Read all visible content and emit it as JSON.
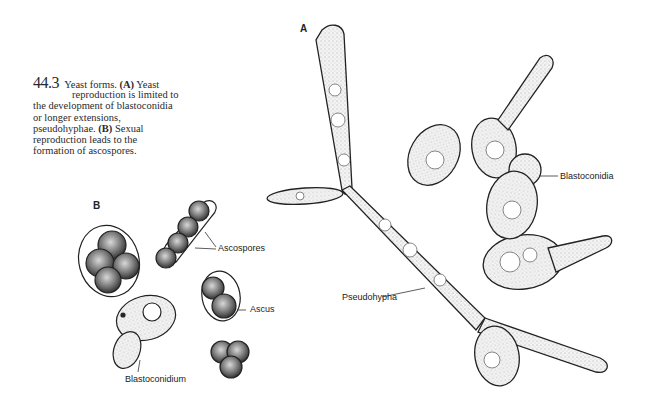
{
  "figure": {
    "number": "44.3",
    "caption": {
      "title": "Yeast forms.",
      "part_a_marker": "(A)",
      "part_a_text_1": "Yeast",
      "part_a_text_2": "reproduction is limited to",
      "part_a_text_3": "the development of blastoconidia",
      "part_a_text_4": "or longer extensions,",
      "part_a_text_5": "pseudohyphae.",
      "part_b_marker": "(B)",
      "part_b_text_1": "Sexual",
      "part_b_text_2": "reproduction leads to the",
      "part_b_text_3": "formation of ascospores."
    },
    "panels": {
      "a": {
        "label": "A"
      },
      "b": {
        "label": "B"
      }
    },
    "labels": {
      "ascospores": "Ascospores",
      "ascus": "Ascus",
      "blastoconidium": "Blastoconidium",
      "pseudohypha": "Pseudohypha",
      "blastoconidia": "Blastoconidia"
    },
    "colors": {
      "ink": "#222222",
      "cell_fill": "#f4f4f4",
      "spore_fill": "#6a6a6a"
    }
  }
}
